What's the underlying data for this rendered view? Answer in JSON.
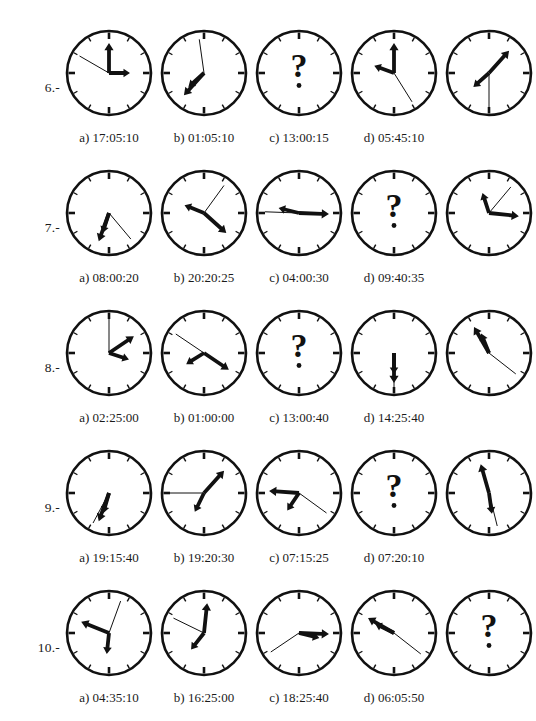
{
  "page": {
    "background": "#ffffff",
    "ink": "#111111",
    "question_mark": "?"
  },
  "geometry": {
    "clock_x": [
      62,
      157,
      252,
      347,
      442
    ],
    "label_x": [
      50,
      145,
      240,
      335
    ],
    "row_y": [
      22,
      162,
      302,
      442,
      582
    ],
    "radius": 42,
    "center": 47
  },
  "rows": [
    {
      "number": "6.-",
      "labels": [
        "a) 17:05:10",
        "b) 01:05:10",
        "c) 13:00:15",
        "d) 05:45:10"
      ],
      "question_index": 2,
      "clocks": [
        {
          "name": "clock-6-1",
          "hour": 90,
          "minute": 0,
          "second": 300
        },
        {
          "name": "clock-6-2",
          "hour": 228,
          "minute": 222,
          "second": 352
        },
        {
          "name": "clock-6-3",
          "hour": null,
          "minute": null,
          "second": null
        },
        {
          "name": "clock-6-4",
          "hour": 290,
          "minute": 0,
          "second": 148
        },
        {
          "name": "clock-6-5",
          "hour": 228,
          "minute": 42,
          "second": 180
        }
      ]
    },
    {
      "number": "7.-",
      "labels": [
        "a) 08:00:20",
        "b) 20:20:25",
        "c) 04:00:30",
        "d) 09:40:35"
      ],
      "question_index": 3,
      "clocks": [
        {
          "name": "clock-7-1",
          "hour": 198,
          "minute": 200,
          "second": 140
        },
        {
          "name": "clock-7-2",
          "hour": 292,
          "minute": 132,
          "second": 36
        },
        {
          "name": "clock-7-3",
          "hour": 284,
          "minute": 92,
          "second": 272
        },
        {
          "name": "clock-7-4",
          "hour": null,
          "minute": null,
          "second": null
        },
        {
          "name": "clock-7-5",
          "hour": 342,
          "minute": 96,
          "second": 40
        }
      ]
    },
    {
      "number": "8.-",
      "labels": [
        "a) 02:25:00",
        "b) 01:00:00",
        "c) 13:00:40",
        "d) 14:25:40"
      ],
      "question_index": 2,
      "clocks": [
        {
          "name": "clock-8-1",
          "hour": 108,
          "minute": 56,
          "second": 0
        },
        {
          "name": "clock-8-2",
          "hour": 238,
          "minute": 124,
          "second": 304
        },
        {
          "name": "clock-8-3",
          "hour": null,
          "minute": null,
          "second": null
        },
        {
          "name": "clock-8-4",
          "hour": 180,
          "minute": 180,
          "second": 180
        },
        {
          "name": "clock-8-5",
          "hour": 338,
          "minute": 330,
          "second": 128
        }
      ]
    },
    {
      "number": "9.-",
      "labels": [
        "a) 19:15:40",
        "b) 19:20:30",
        "c) 07:15:25",
        "d) 07:20:10"
      ],
      "question_index": 3,
      "clocks": [
        {
          "name": "clock-9-1",
          "hour": 196,
          "minute": 200,
          "second": 208
        },
        {
          "name": "clock-9-2",
          "hour": 206,
          "minute": 42,
          "second": 270
        },
        {
          "name": "clock-9-3",
          "hour": 214,
          "minute": 274,
          "second": 126
        },
        {
          "name": "clock-9-4",
          "hour": null,
          "minute": null,
          "second": null
        },
        {
          "name": "clock-9-5",
          "hour": 172,
          "minute": 344,
          "second": 166
        }
      ]
    },
    {
      "number": "10.-",
      "labels": [
        "a) 04:35:10",
        "b) 16:25:00",
        "c) 18:25:40",
        "d) 06:05:50"
      ],
      "question_index": 4,
      "clocks": [
        {
          "name": "clock-10-1",
          "hour": 186,
          "minute": 292,
          "second": 20
        },
        {
          "name": "clock-10-2",
          "hour": 218,
          "minute": 6,
          "second": 296
        },
        {
          "name": "clock-10-3",
          "hour": 104,
          "minute": 92,
          "second": 236
        },
        {
          "name": "clock-10-4",
          "hour": 296,
          "minute": 300,
          "second": 128
        },
        {
          "name": "clock-10-5",
          "hour": null,
          "minute": null,
          "second": null
        }
      ]
    }
  ]
}
